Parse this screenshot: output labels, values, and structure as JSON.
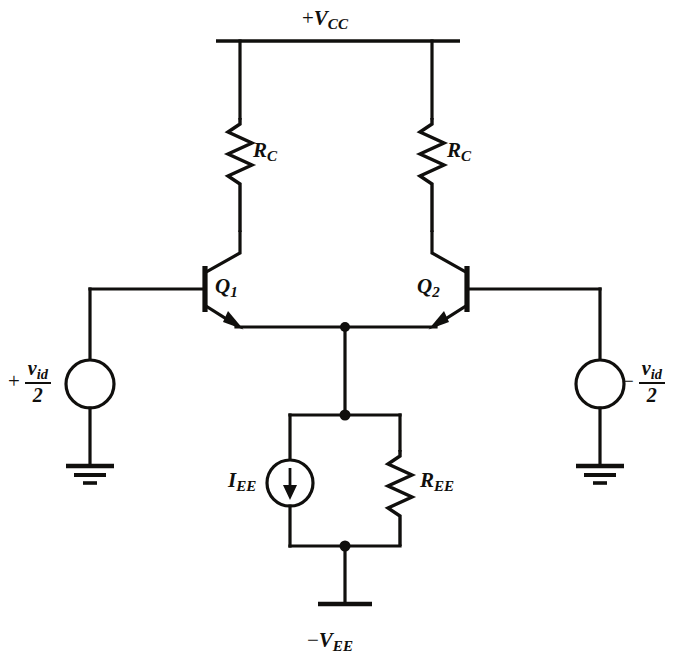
{
  "diagram": {
    "type": "circuit-schematic",
    "ink_color": "#100f0d",
    "background_color": "#ffffff"
  },
  "supplies": {
    "positive": {
      "sign": "+",
      "symbol": "V",
      "subscript": "CC",
      "text": "+VCC"
    },
    "negative": {
      "sign": "−",
      "symbol": "V",
      "subscript": "EE",
      "text": "−VEE"
    }
  },
  "components": {
    "rc_left": {
      "symbol": "R",
      "subscript": "C",
      "text": "RC",
      "kind": "resistor"
    },
    "rc_right": {
      "symbol": "R",
      "subscript": "C",
      "text": "RC",
      "kind": "resistor"
    },
    "ree": {
      "symbol": "R",
      "subscript": "EE",
      "text": "REE",
      "kind": "resistor"
    },
    "iee": {
      "symbol": "I",
      "subscript": "EE",
      "text": "IEE",
      "kind": "current-source",
      "arrow_direction": "down"
    },
    "q1": {
      "symbol": "Q",
      "subscript": "1",
      "text": "Q1",
      "kind": "npn-transistor"
    },
    "q2": {
      "symbol": "Q",
      "subscript": "2",
      "text": "Q2",
      "kind": "npn-transistor"
    }
  },
  "sources": {
    "left": {
      "sign": "+",
      "numerator_symbol": "v",
      "numerator_subscript": "id",
      "denominator": "2",
      "text": "+vid/2",
      "kind": "voltage-source"
    },
    "right": {
      "sign": "−",
      "numerator_symbol": "v",
      "numerator_subscript": "id",
      "denominator": "2",
      "text": "−vid/2",
      "kind": "voltage-source"
    }
  },
  "grounds": {
    "left_label": "ground",
    "right_label": "ground",
    "bottom_label": "supply-terminal"
  }
}
